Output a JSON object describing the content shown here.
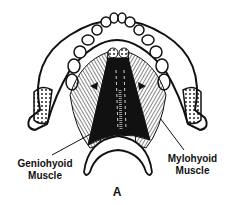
{
  "figure": {
    "panel_label": "A",
    "labels": {
      "geniohyoid_line1": "Geniohyoid",
      "geniohyoid_line2": "Muscle",
      "mylohyoid_line1": "Mylohyoid",
      "mylohyoid_line2": "Muscle"
    },
    "colors": {
      "ink": "#111111",
      "background": "#ffffff"
    }
  }
}
